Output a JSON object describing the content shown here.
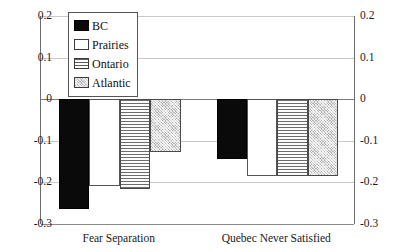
{
  "chart_data": {
    "type": "bar",
    "title": "",
    "subtitle": "",
    "xlabel": "",
    "ylabel": "",
    "categories": [
      "Fear Separation",
      "Quebec Never Satisfied"
    ],
    "series": [
      {
        "name": "BC",
        "values": [
          -0.265,
          -0.143
        ]
      },
      {
        "name": "Prairies",
        "values": [
          -0.208,
          -0.185
        ]
      },
      {
        "name": "Ontario",
        "values": [
          -0.215,
          -0.185
        ]
      },
      {
        "name": "Atlantic",
        "values": [
          -0.127,
          -0.185
        ]
      }
    ],
    "ylim": [
      -0.3,
      0.2
    ],
    "yticks": [
      0.2,
      0.1,
      0,
      -0.1,
      -0.2,
      -0.3
    ],
    "ytick_labels": [
      "0.2",
      "0.1",
      "0",
      "-0.1",
      "-0.2",
      "-0.3"
    ],
    "right_axis_ytick_labels": [
      "0.2",
      "0.1",
      "0",
      "-0.1",
      "-0.2",
      "-0.3"
    ],
    "grid": true,
    "legend_position": "top-left-inside",
    "legend_entries": [
      {
        "label": "BC",
        "pattern": "solid-black",
        "color": "#0a0a0a"
      },
      {
        "label": "Prairies",
        "pattern": "solid-white",
        "color": "#ffffff"
      },
      {
        "label": "Ontario",
        "pattern": "horizontal-lines",
        "color": "#f2f2f2"
      },
      {
        "label": "Atlantic",
        "pattern": "gray-checker",
        "color": "#b4b4b4"
      }
    ]
  },
  "axis": {
    "left_ticks": [
      "0.2",
      "0.1",
      "0",
      "-0.1",
      "-0.2",
      "-0.3"
    ],
    "right_ticks": [
      "0.2",
      "0.1",
      "0",
      "-0.1",
      "-0.2",
      "-0.3"
    ]
  },
  "categories": {
    "first": "Fear Separation",
    "second": "Quebec Never Satisfied"
  },
  "legend": {
    "bc": "BC",
    "prairies": "Prairies",
    "ontario": "Ontario",
    "atlantic": "Atlantic"
  }
}
